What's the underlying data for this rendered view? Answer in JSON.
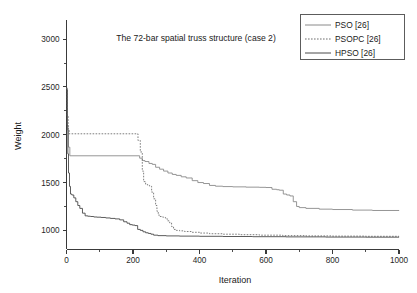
{
  "chart_data": {
    "type": "line",
    "title": "The 72-bar spatial truss structure (case 2)",
    "xlabel": "Iteration",
    "ylabel": "Weight",
    "xlim": [
      0,
      1000
    ],
    "ylim": [
      800,
      3200
    ],
    "grid": false,
    "legend_position": "top-right",
    "xticks": [
      0,
      200,
      400,
      600,
      800,
      1000
    ],
    "yticks": [
      1000,
      1500,
      2000,
      2500,
      3000
    ],
    "xtick_labels": [
      "0",
      "200",
      "400",
      "600",
      "800",
      "1000"
    ],
    "ytick_labels": [
      "1000",
      "1500",
      "2000",
      "2500",
      "3000"
    ],
    "xminor_ticks": [
      100,
      300,
      500,
      700,
      900
    ],
    "yminor_ticks": [
      1250,
      1750,
      2250,
      2750
    ],
    "series": [
      {
        "name": "PSO [26]",
        "style": "solid",
        "color": "#8a8a8a",
        "x": [
          0,
          3,
          6,
          10,
          215,
          220,
          228,
          236,
          248,
          258,
          268,
          280,
          292,
          305,
          318,
          330,
          345,
          360,
          378,
          395,
          412,
          430,
          448,
          470,
          500,
          540,
          580,
          600,
          618,
          632,
          640,
          652,
          662,
          672,
          682,
          692,
          700,
          720,
          760,
          800,
          860,
          920,
          1000
        ],
        "y": [
          2480,
          2050,
          1870,
          1780,
          1780,
          1755,
          1730,
          1720,
          1700,
          1690,
          1660,
          1640,
          1620,
          1600,
          1585,
          1575,
          1560,
          1548,
          1520,
          1500,
          1490,
          1470,
          1462,
          1458,
          1455,
          1452,
          1450,
          1448,
          1430,
          1425,
          1420,
          1380,
          1370,
          1360,
          1300,
          1250,
          1238,
          1230,
          1222,
          1218,
          1212,
          1208,
          1205
        ]
      },
      {
        "name": "PSOPC [26]",
        "style": "dotted",
        "color": "#6e6e6e",
        "x": [
          0,
          2,
          5,
          8,
          210,
          215,
          222,
          228,
          232,
          238,
          244,
          250,
          256,
          262,
          268,
          272,
          276,
          280,
          286,
          292,
          298,
          304,
          310,
          316,
          322,
          330,
          340,
          355,
          375,
          400,
          430,
          470,
          520,
          580,
          650,
          720,
          800,
          900,
          1000
        ],
        "y": [
          2490,
          2200,
          2060,
          2010,
          2010,
          1940,
          1820,
          1620,
          1510,
          1480,
          1470,
          1460,
          1400,
          1330,
          1260,
          1200,
          1160,
          1145,
          1140,
          1135,
          1120,
          1100,
          1080,
          1040,
          1010,
          1000,
          995,
          988,
          980,
          972,
          965,
          960,
          955,
          950,
          945,
          942,
          940,
          938,
          936
        ]
      },
      {
        "name": "HPSO [26]",
        "style": "solid",
        "color": "#4a4a4a",
        "x": [
          0,
          2,
          4,
          6,
          9,
          12,
          16,
          22,
          28,
          34,
          40,
          48,
          56,
          64,
          72,
          82,
          92,
          104,
          118,
          132,
          146,
          160,
          172,
          182,
          190,
          198,
          206,
          214,
          222,
          230,
          238,
          246,
          254,
          262,
          275,
          300,
          340,
          400,
          470,
          560,
          660,
          780,
          900,
          1000
        ],
        "y": [
          2470,
          2100,
          1800,
          1600,
          1460,
          1380,
          1370,
          1340,
          1300,
          1260,
          1230,
          1180,
          1152,
          1148,
          1145,
          1140,
          1138,
          1135,
          1130,
          1125,
          1120,
          1110,
          1090,
          1075,
          1060,
          1055,
          1050,
          1010,
          1000,
          985,
          975,
          968,
          960,
          950,
          945,
          942,
          940,
          938,
          936,
          934,
          932,
          930,
          929,
          928
        ]
      }
    ]
  },
  "legend": {
    "items": [
      {
        "label": "PSO [26]"
      },
      {
        "label": "PSOPC [26]"
      },
      {
        "label": "HPSO [26]"
      }
    ]
  }
}
